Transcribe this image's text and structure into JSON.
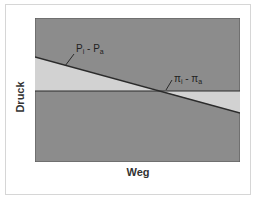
{
  "diagram": {
    "axes": {
      "ylabel": "Druck",
      "xlabel": "Weg"
    },
    "lines": [
      {
        "name": "hydrostatic-pressure-difference",
        "label_main": "P",
        "label_sub1": "i",
        "label_sep": " - ",
        "label_main2": "P",
        "label_sub2": "a",
        "type": "sloped",
        "start_y_frac": 0.27,
        "end_y_frac": 0.66
      },
      {
        "name": "oncotic-pressure-difference",
        "label_main": "π",
        "label_sub1": "i",
        "label_sep": " - ",
        "label_main2": "π",
        "label_sub2": "a",
        "type": "horizontal",
        "y_frac": 0.5
      }
    ],
    "colors": {
      "background": "#8c8c8c",
      "fill_region": "#d2d2d2",
      "line": "#2b2b2b",
      "frame_border": "#d6d6d6"
    }
  }
}
